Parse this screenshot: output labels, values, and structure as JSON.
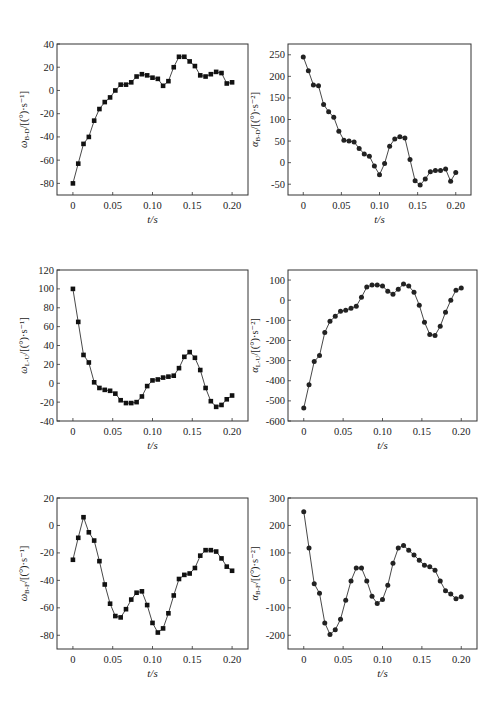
{
  "chart_data": [
    {
      "id": "omega-bd",
      "type": "line",
      "marker": "square",
      "title": "",
      "xlabel": "t/s",
      "ylabel_symbol": "ω",
      "ylabel_sub": "B-D",
      "ylabel_unit": "/[(°)·s⁻¹]",
      "xlim": [
        -0.02,
        0.22
      ],
      "ylim": [
        -90,
        40
      ],
      "xticks": [
        0,
        0.05,
        0.1,
        0.15,
        0.2
      ],
      "xtick_labels": [
        "0",
        "0.05",
        "0.10",
        "0.15",
        "0.20"
      ],
      "yticks": [
        -80,
        -60,
        -40,
        -20,
        0,
        20,
        40
      ],
      "ytick_labels": [
        "-80",
        "-60",
        "-40",
        "-20",
        "0",
        "20",
        "40"
      ],
      "x": [
        0,
        0.0067,
        0.0133,
        0.02,
        0.0267,
        0.0333,
        0.04,
        0.0467,
        0.0533,
        0.06,
        0.0667,
        0.0733,
        0.08,
        0.0867,
        0.0933,
        0.1,
        0.1067,
        0.1133,
        0.12,
        0.1267,
        0.1333,
        0.14,
        0.1467,
        0.1533,
        0.16,
        0.1667,
        0.1733,
        0.18,
        0.1867,
        0.1933,
        0.2
      ],
      "values": [
        -80,
        -63,
        -46,
        -40,
        -26,
        -16,
        -10,
        -6,
        0,
        5,
        5,
        7,
        12,
        14,
        13,
        11,
        10,
        4,
        8,
        20,
        29,
        29,
        25,
        21,
        13,
        12,
        14,
        16,
        15,
        6,
        7
      ]
    },
    {
      "id": "alpha-bd",
      "type": "line",
      "marker": "circle",
      "title": "",
      "xlabel": "t/s",
      "ylabel_symbol": "α",
      "ylabel_sub": "B-D",
      "ylabel_unit": "/[(°)·s⁻²]",
      "xlim": [
        -0.02,
        0.22
      ],
      "ylim": [
        -75,
        275
      ],
      "xticks": [
        0,
        0.05,
        0.1,
        0.15,
        0.2
      ],
      "xtick_labels": [
        "0",
        "0.05",
        "0.10",
        "0.15",
        "0.20"
      ],
      "yticks": [
        -50,
        0,
        50,
        100,
        150,
        200,
        250
      ],
      "ytick_labels": [
        "-50",
        "0",
        "50",
        "100",
        "150",
        "200",
        "250"
      ],
      "x": [
        0,
        0.0067,
        0.0133,
        0.02,
        0.0267,
        0.0333,
        0.04,
        0.0467,
        0.0533,
        0.06,
        0.0667,
        0.0733,
        0.08,
        0.0867,
        0.0933,
        0.1,
        0.1067,
        0.1133,
        0.12,
        0.1267,
        0.1333,
        0.14,
        0.1467,
        0.1533,
        0.16,
        0.1667,
        0.1733,
        0.18,
        0.1867,
        0.1933,
        0.2
      ],
      "values": [
        245,
        213,
        180,
        178,
        135,
        118,
        105,
        73,
        52,
        50,
        48,
        33,
        20,
        15,
        -8,
        -28,
        -2,
        38,
        55,
        60,
        57,
        7,
        -42,
        -52,
        -38,
        -21,
        -18,
        -18,
        -15,
        -43,
        -23
      ]
    },
    {
      "id": "omega-lu",
      "type": "line",
      "marker": "square",
      "title": "",
      "xlabel": "t/s",
      "ylabel_symbol": "ω",
      "ylabel_sub": "L-U",
      "ylabel_unit": "/[(°)·s⁻¹]",
      "xlim": [
        -0.02,
        0.22
      ],
      "ylim": [
        -40,
        120
      ],
      "xticks": [
        0,
        0.05,
        0.1,
        0.15,
        0.2
      ],
      "xtick_labels": [
        "0",
        "0.05",
        "0.10",
        "0.15",
        "0.20"
      ],
      "yticks": [
        -40,
        -20,
        0,
        20,
        40,
        60,
        80,
        100,
        120
      ],
      "ytick_labels": [
        "-40",
        "-20",
        "0",
        "20",
        "40",
        "60",
        "80",
        "100",
        "120"
      ],
      "x": [
        0,
        0.0067,
        0.0133,
        0.02,
        0.0267,
        0.0333,
        0.04,
        0.0467,
        0.0533,
        0.06,
        0.0667,
        0.0733,
        0.08,
        0.0867,
        0.0933,
        0.1,
        0.1067,
        0.1133,
        0.12,
        0.1267,
        0.1333,
        0.14,
        0.1467,
        0.1533,
        0.16,
        0.1667,
        0.1733,
        0.18,
        0.1867,
        0.1933,
        0.2
      ],
      "values": [
        100,
        65,
        30,
        22,
        1,
        -5,
        -7,
        -8,
        -11,
        -18,
        -21,
        -21,
        -20,
        -14,
        -3,
        3,
        4,
        6,
        7,
        8,
        16,
        28,
        33,
        27,
        14,
        -5,
        -19,
        -25,
        -23,
        -17,
        -13
      ]
    },
    {
      "id": "alpha-lu",
      "type": "line",
      "marker": "circle",
      "title": "",
      "xlabel": "t/s",
      "ylabel_symbol": "α",
      "ylabel_sub": "L-U",
      "ylabel_unit": "/[(°)·s⁻²]",
      "xlim": [
        -0.02,
        0.22
      ],
      "ylim": [
        -600,
        150
      ],
      "xticks": [
        0,
        0.05,
        0.1,
        0.15,
        0.2
      ],
      "xtick_labels": [
        "0",
        "0.05",
        "0.10",
        "0.15",
        "0.20"
      ],
      "yticks": [
        -600,
        -500,
        -400,
        -300,
        -200,
        -100,
        0,
        100
      ],
      "ytick_labels": [
        "-600",
        "-500",
        "-400",
        "-300",
        "-200",
        "-100",
        "0",
        "100"
      ],
      "x": [
        0,
        0.0067,
        0.0133,
        0.02,
        0.0267,
        0.0333,
        0.04,
        0.0467,
        0.0533,
        0.06,
        0.0667,
        0.0733,
        0.08,
        0.0867,
        0.0933,
        0.1,
        0.1067,
        0.1133,
        0.12,
        0.1267,
        0.1333,
        0.14,
        0.1467,
        0.1533,
        0.16,
        0.1667,
        0.1733,
        0.18,
        0.1867,
        0.1933,
        0.2
      ],
      "values": [
        -535,
        -420,
        -305,
        -275,
        -160,
        -105,
        -80,
        -55,
        -50,
        -40,
        -30,
        15,
        65,
        75,
        75,
        70,
        45,
        30,
        55,
        80,
        70,
        40,
        -25,
        -110,
        -170,
        -175,
        -130,
        -60,
        0,
        50,
        60
      ]
    },
    {
      "id": "omega-bf",
      "type": "line",
      "marker": "square",
      "title": "",
      "xlabel": "t/s",
      "ylabel_symbol": "ω",
      "ylabel_sub": "B-F",
      "ylabel_unit": "/[(°)·s⁻¹]",
      "xlim": [
        -0.02,
        0.22
      ],
      "ylim": [
        -90,
        20
      ],
      "xticks": [
        0,
        0.05,
        0.1,
        0.15,
        0.2
      ],
      "xtick_labels": [
        "0",
        "0.05",
        "0.10",
        "0.15",
        "0.20"
      ],
      "yticks": [
        -80,
        -60,
        -40,
        -20,
        0,
        20
      ],
      "ytick_labels": [
        "-80",
        "-60",
        "-40",
        "-20",
        "0",
        "20"
      ],
      "x": [
        0,
        0.0067,
        0.0133,
        0.02,
        0.0267,
        0.0333,
        0.04,
        0.0467,
        0.0533,
        0.06,
        0.0667,
        0.0733,
        0.08,
        0.0867,
        0.0933,
        0.1,
        0.1067,
        0.1133,
        0.12,
        0.1267,
        0.1333,
        0.14,
        0.1467,
        0.1533,
        0.16,
        0.1667,
        0.1733,
        0.18,
        0.1867,
        0.1933,
        0.2
      ],
      "values": [
        -25,
        -9,
        6,
        -5,
        -11,
        -26,
        -43,
        -57,
        -66,
        -67,
        -61,
        -54,
        -49,
        -48,
        -58,
        -71,
        -78,
        -75,
        -64,
        -51,
        -39,
        -36,
        -35,
        -31,
        -22,
        -18,
        -18,
        -19,
        -24,
        -30,
        -33
      ]
    },
    {
      "id": "alpha-bf",
      "type": "line",
      "marker": "circle",
      "title": "",
      "xlabel": "t/s",
      "ylabel_symbol": "α",
      "ylabel_sub": "B-F",
      "ylabel_unit": "/[(°)·s⁻²]",
      "xlim": [
        -0.02,
        0.22
      ],
      "ylim": [
        -250,
        300
      ],
      "xticks": [
        0,
        0.05,
        0.1,
        0.15,
        0.2
      ],
      "xtick_labels": [
        "0",
        "0.05",
        "0.10",
        "0.15",
        "0.20"
      ],
      "yticks": [
        -200,
        -100,
        0,
        100,
        200,
        300
      ],
      "ytick_labels": [
        "-200",
        "-100",
        "0",
        "100",
        "200",
        "300"
      ],
      "x": [
        0,
        0.0067,
        0.0133,
        0.02,
        0.0267,
        0.0333,
        0.04,
        0.0467,
        0.0533,
        0.06,
        0.0667,
        0.0733,
        0.08,
        0.0867,
        0.0933,
        0.1,
        0.1067,
        0.1133,
        0.12,
        0.1267,
        0.1333,
        0.14,
        0.1467,
        0.1533,
        0.16,
        0.1667,
        0.1733,
        0.18,
        0.1867,
        0.1933,
        0.2
      ],
      "values": [
        250,
        118,
        -12,
        -47,
        -155,
        -197,
        -180,
        -142,
        -72,
        -2,
        45,
        45,
        -2,
        -58,
        -84,
        -70,
        -18,
        62,
        118,
        127,
        110,
        92,
        73,
        55,
        50,
        37,
        -2,
        -38,
        -50,
        -67,
        -60
      ]
    }
  ],
  "layout": {
    "panels": [
      {
        "left": 0,
        "top": 0,
        "plot": {
          "x": 57,
          "y": 44,
          "w": 191,
          "h": 151
        }
      },
      {
        "left": 250,
        "top": 0,
        "plot": {
          "x": 38,
          "y": 44,
          "w": 183,
          "h": 151
        }
      },
      {
        "left": 0,
        "top": 230,
        "plot": {
          "x": 57,
          "y": 40,
          "w": 191,
          "h": 151
        }
      },
      {
        "left": 250,
        "top": 230,
        "plot": {
          "x": 38,
          "y": 40,
          "w": 189,
          "h": 151
        }
      },
      {
        "left": 0,
        "top": 460,
        "plot": {
          "x": 57,
          "y": 38,
          "w": 191,
          "h": 151
        }
      },
      {
        "left": 250,
        "top": 460,
        "plot": {
          "x": 38,
          "y": 38,
          "w": 189,
          "h": 151
        }
      }
    ]
  }
}
